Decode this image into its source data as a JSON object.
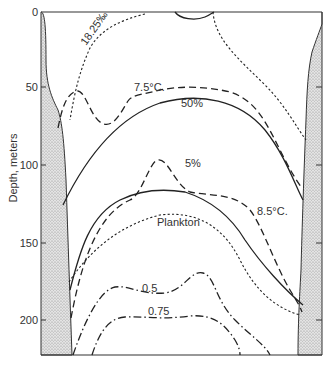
{
  "figure": {
    "type": "lake cross-section depth profile",
    "y_axis": {
      "title": "Depth, meters",
      "ticks": [
        "0",
        "50",
        "100",
        "150",
        "200"
      ],
      "tick_values": [
        0,
        50,
        100,
        150,
        200
      ],
      "range": [
        0,
        220
      ]
    },
    "shores": {
      "left": "stippled-shore-left",
      "right": "stippled-shore-right",
      "fill_color": "#cfcfcf"
    },
    "isolines": [
      {
        "id": "salinity",
        "label": "18.25‰",
        "style": "dotted",
        "description": "salinity isoline"
      },
      {
        "id": "temp75",
        "label": "7.5°C.",
        "style": "dashed",
        "description": "7.5 °C isotherm"
      },
      {
        "id": "light50",
        "label": "50%",
        "style": "solid",
        "description": "50% light penetration"
      },
      {
        "id": "light5",
        "label": "5%",
        "style": "solid",
        "description": "5% light penetration"
      },
      {
        "id": "temp85",
        "label": "8.5°C.",
        "style": "dashed",
        "description": "8.5 °C isotherm"
      },
      {
        "id": "plankton",
        "label": "Plankton",
        "style": "dotted",
        "description": "plankton boundary"
      },
      {
        "id": "oxy05",
        "label": "0.5",
        "style": "dash-dot",
        "description": "0.5 isoline"
      },
      {
        "id": "oxy075",
        "label": "0.75",
        "style": "dash-dot",
        "description": "0.75 isoline"
      }
    ]
  }
}
